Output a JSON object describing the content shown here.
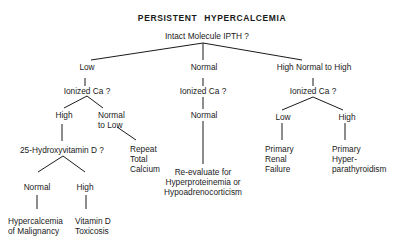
{
  "title": "PERSISTENT HYPERCALCEMIA",
  "root": "Intact Molecule IPTH ?",
  "branches": {
    "low": {
      "label": "Low",
      "question": "Ionized Ca ?",
      "high": {
        "label": "High",
        "question": "25-Hydroxyvitamin D ?",
        "normal": {
          "label": "Normal",
          "outcome_line1": "Hypercalcemia",
          "outcome_line2": "of Malignancy"
        },
        "high": {
          "label": "High",
          "outcome_line1": "Vitamin D",
          "outcome_line2": "Toxicosis"
        }
      },
      "normal_to_low": {
        "label_line1": "Normal",
        "label_line2": "to Low",
        "outcome_line1": "Repeat",
        "outcome_line2": "Total",
        "outcome_line3": "Calcium"
      }
    },
    "normal": {
      "label": "Normal",
      "question": "Ionized Ca ?",
      "answer": "Normal",
      "outcome_line1": "Re-evaluate for",
      "outcome_line2": "Hyperproteinemia or",
      "outcome_line3": "Hypoadrenocorticism"
    },
    "high_normal_to_high": {
      "label": "High Normal to High",
      "question": "Ionized Ca ?",
      "low": {
        "label": "Low",
        "outcome_line1": "Primary",
        "outcome_line2": "Renal",
        "outcome_line3": "Failure"
      },
      "high": {
        "label": "High",
        "outcome_line1": "Primary",
        "outcome_line2": "Hyper-",
        "outcome_line3": "parathyroidism"
      }
    }
  }
}
